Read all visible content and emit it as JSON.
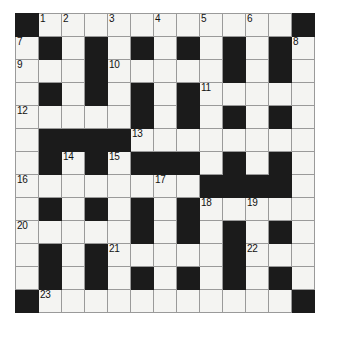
{
  "puzzle": {
    "title": "Crossword Grid",
    "type": "crossword",
    "rows": 13,
    "columns": 13,
    "cell_size_px": 23,
    "colors": {
      "block": "#1b1b1b",
      "open": "#f4f4f2",
      "grid_line": "#9a9a9a",
      "number_text": "#111111",
      "background": "#ffffff"
    },
    "highest_clue_number": 23,
    "clue_numbers": [
      1,
      2,
      3,
      4,
      5,
      6,
      7,
      8,
      9,
      10,
      11,
      12,
      13,
      14,
      15,
      16,
      17,
      18,
      19,
      20,
      21,
      22,
      23
    ],
    "grid": [
      [
        {
          "block": true,
          "number": null
        },
        {
          "block": false,
          "number": "1"
        },
        {
          "block": false,
          "number": "2"
        },
        {
          "block": false,
          "number": null
        },
        {
          "block": false,
          "number": "3"
        },
        {
          "block": false,
          "number": null
        },
        {
          "block": false,
          "number": "4"
        },
        {
          "block": false,
          "number": null
        },
        {
          "block": false,
          "number": "5"
        },
        {
          "block": false,
          "number": null
        },
        {
          "block": false,
          "number": "6"
        },
        {
          "block": false,
          "number": null
        },
        {
          "block": true,
          "number": null
        }
      ],
      [
        {
          "block": false,
          "number": "7"
        },
        {
          "block": true,
          "number": null
        },
        {
          "block": false,
          "number": null
        },
        {
          "block": true,
          "number": null
        },
        {
          "block": false,
          "number": null
        },
        {
          "block": true,
          "number": null
        },
        {
          "block": false,
          "number": null
        },
        {
          "block": true,
          "number": null
        },
        {
          "block": false,
          "number": null
        },
        {
          "block": true,
          "number": null
        },
        {
          "block": false,
          "number": null
        },
        {
          "block": true,
          "number": null
        },
        {
          "block": false,
          "number": "8"
        }
      ],
      [
        {
          "block": false,
          "number": "9"
        },
        {
          "block": false,
          "number": null
        },
        {
          "block": false,
          "number": null
        },
        {
          "block": true,
          "number": null
        },
        {
          "block": false,
          "number": "10"
        },
        {
          "block": false,
          "number": null
        },
        {
          "block": false,
          "number": null
        },
        {
          "block": false,
          "number": null
        },
        {
          "block": false,
          "number": null
        },
        {
          "block": true,
          "number": null
        },
        {
          "block": false,
          "number": null
        },
        {
          "block": true,
          "number": null
        },
        {
          "block": false,
          "number": null
        }
      ],
      [
        {
          "block": false,
          "number": null
        },
        {
          "block": true,
          "number": null
        },
        {
          "block": false,
          "number": null
        },
        {
          "block": true,
          "number": null
        },
        {
          "block": false,
          "number": null
        },
        {
          "block": true,
          "number": null
        },
        {
          "block": false,
          "number": null
        },
        {
          "block": true,
          "number": null
        },
        {
          "block": false,
          "number": "11"
        },
        {
          "block": false,
          "number": null
        },
        {
          "block": false,
          "number": null
        },
        {
          "block": false,
          "number": null
        },
        {
          "block": false,
          "number": null
        }
      ],
      [
        {
          "block": false,
          "number": "12"
        },
        {
          "block": false,
          "number": null
        },
        {
          "block": false,
          "number": null
        },
        {
          "block": false,
          "number": null
        },
        {
          "block": false,
          "number": null
        },
        {
          "block": true,
          "number": null
        },
        {
          "block": false,
          "number": null
        },
        {
          "block": true,
          "number": null
        },
        {
          "block": false,
          "number": null
        },
        {
          "block": true,
          "number": null
        },
        {
          "block": false,
          "number": null
        },
        {
          "block": true,
          "number": null
        },
        {
          "block": false,
          "number": null
        }
      ],
      [
        {
          "block": false,
          "number": null
        },
        {
          "block": true,
          "number": null
        },
        {
          "block": true,
          "number": null
        },
        {
          "block": true,
          "number": null
        },
        {
          "block": true,
          "number": null
        },
        {
          "block": false,
          "number": "13"
        },
        {
          "block": false,
          "number": null
        },
        {
          "block": false,
          "number": null
        },
        {
          "block": false,
          "number": null
        },
        {
          "block": false,
          "number": null
        },
        {
          "block": false,
          "number": null
        },
        {
          "block": false,
          "number": null
        },
        {
          "block": false,
          "number": null
        }
      ],
      [
        {
          "block": false,
          "number": null
        },
        {
          "block": true,
          "number": null
        },
        {
          "block": false,
          "number": "14"
        },
        {
          "block": true,
          "number": null
        },
        {
          "block": false,
          "number": "15"
        },
        {
          "block": true,
          "number": null
        },
        {
          "block": true,
          "number": null
        },
        {
          "block": true,
          "number": null
        },
        {
          "block": false,
          "number": null
        },
        {
          "block": true,
          "number": null
        },
        {
          "block": false,
          "number": null
        },
        {
          "block": true,
          "number": null
        },
        {
          "block": false,
          "number": null
        }
      ],
      [
        {
          "block": false,
          "number": "16"
        },
        {
          "block": false,
          "number": null
        },
        {
          "block": false,
          "number": null
        },
        {
          "block": false,
          "number": null
        },
        {
          "block": false,
          "number": null
        },
        {
          "block": false,
          "number": null
        },
        {
          "block": false,
          "number": "17"
        },
        {
          "block": false,
          "number": null
        },
        {
          "block": true,
          "number": null
        },
        {
          "block": true,
          "number": null
        },
        {
          "block": true,
          "number": null
        },
        {
          "block": true,
          "number": null
        },
        {
          "block": false,
          "number": null
        }
      ],
      [
        {
          "block": false,
          "number": null
        },
        {
          "block": true,
          "number": null
        },
        {
          "block": false,
          "number": null
        },
        {
          "block": true,
          "number": null
        },
        {
          "block": false,
          "number": null
        },
        {
          "block": true,
          "number": null
        },
        {
          "block": false,
          "number": null
        },
        {
          "block": true,
          "number": null
        },
        {
          "block": false,
          "number": "18"
        },
        {
          "block": false,
          "number": null
        },
        {
          "block": false,
          "number": "19"
        },
        {
          "block": false,
          "number": null
        },
        {
          "block": false,
          "number": null
        }
      ],
      [
        {
          "block": false,
          "number": "20"
        },
        {
          "block": false,
          "number": null
        },
        {
          "block": false,
          "number": null
        },
        {
          "block": false,
          "number": null
        },
        {
          "block": false,
          "number": null
        },
        {
          "block": true,
          "number": null
        },
        {
          "block": false,
          "number": null
        },
        {
          "block": true,
          "number": null
        },
        {
          "block": false,
          "number": null
        },
        {
          "block": true,
          "number": null
        },
        {
          "block": false,
          "number": null
        },
        {
          "block": true,
          "number": null
        },
        {
          "block": false,
          "number": null
        }
      ],
      [
        {
          "block": false,
          "number": null
        },
        {
          "block": true,
          "number": null
        },
        {
          "block": false,
          "number": null
        },
        {
          "block": true,
          "number": null
        },
        {
          "block": false,
          "number": "21"
        },
        {
          "block": false,
          "number": null
        },
        {
          "block": false,
          "number": null
        },
        {
          "block": false,
          "number": null
        },
        {
          "block": false,
          "number": null
        },
        {
          "block": true,
          "number": null
        },
        {
          "block": false,
          "number": "22"
        },
        {
          "block": false,
          "number": null
        },
        {
          "block": false,
          "number": null
        }
      ],
      [
        {
          "block": false,
          "number": null
        },
        {
          "block": true,
          "number": null
        },
        {
          "block": false,
          "number": null
        },
        {
          "block": true,
          "number": null
        },
        {
          "block": false,
          "number": null
        },
        {
          "block": true,
          "number": null
        },
        {
          "block": false,
          "number": null
        },
        {
          "block": true,
          "number": null
        },
        {
          "block": false,
          "number": null
        },
        {
          "block": true,
          "number": null
        },
        {
          "block": false,
          "number": null
        },
        {
          "block": true,
          "number": null
        },
        {
          "block": false,
          "number": null
        }
      ],
      [
        {
          "block": true,
          "number": null
        },
        {
          "block": false,
          "number": "23"
        },
        {
          "block": false,
          "number": null
        },
        {
          "block": false,
          "number": null
        },
        {
          "block": false,
          "number": null
        },
        {
          "block": false,
          "number": null
        },
        {
          "block": false,
          "number": null
        },
        {
          "block": false,
          "number": null
        },
        {
          "block": false,
          "number": null
        },
        {
          "block": false,
          "number": null
        },
        {
          "block": false,
          "number": null
        },
        {
          "block": false,
          "number": null
        },
        {
          "block": true,
          "number": null
        }
      ]
    ]
  }
}
